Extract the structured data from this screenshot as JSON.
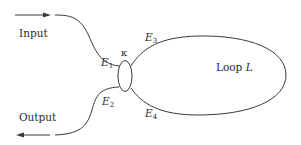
{
  "diagram": {
    "type": "ring-resonator-coupler",
    "colors": {
      "line": "#3a3a3a",
      "text": "#2b2b2b",
      "background": "#ffffff"
    },
    "ports": {
      "input": {
        "label": "Input",
        "direction": "right"
      },
      "output": {
        "label": "Output",
        "direction": "left"
      }
    },
    "coupler": {
      "label": "κ"
    },
    "fields": {
      "e1": {
        "base": "E",
        "sub": "1"
      },
      "e2": {
        "base": "E",
        "sub": "2"
      },
      "e3": {
        "base": "E",
        "sub": "3"
      },
      "e4": {
        "base": "E",
        "sub": "4"
      }
    },
    "loop": {
      "label_prefix": "Loop ",
      "label_var": "L"
    }
  }
}
